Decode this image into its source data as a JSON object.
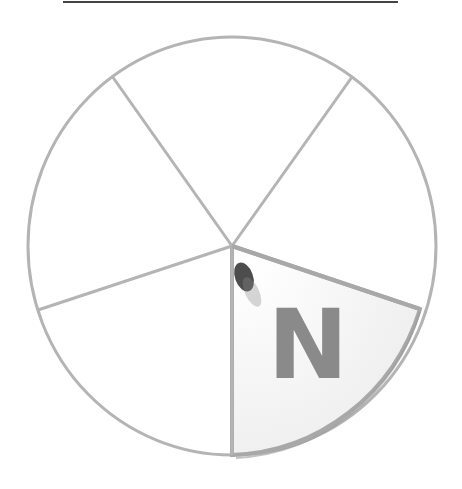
{
  "wheel": {
    "sector_count": 5,
    "highlighted_sector_letter": "N",
    "colors": {
      "outline": "#b4b4b4",
      "highlight_fill": "#f4f4f4",
      "letter": "#8a8a8a",
      "top_rule": "#444444"
    }
  }
}
